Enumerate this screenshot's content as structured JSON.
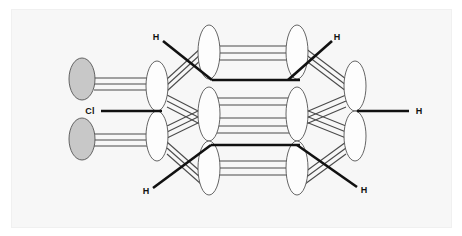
{
  "figure": {
    "background_color": "#ffffff",
    "panel_color": "#f7f7f7",
    "panel_border_color": "#f0f0f0",
    "lobe_fill_white": "#fdfdfd",
    "lobe_fill_gray": "#c8c8c8",
    "lobe_stroke": "#555555",
    "bond_color_thick": "#111111",
    "bond_color_thin": "#4a4a4a"
  },
  "labels": [
    {
      "id": "cl-left",
      "text": "Cl",
      "x": 90,
      "y": 112
    },
    {
      "id": "h-top-left",
      "text": "H",
      "x": 156,
      "y": 38
    },
    {
      "id": "h-bottom-left",
      "text": "H",
      "x": 146,
      "y": 192
    },
    {
      "id": "h-top-right",
      "text": "H",
      "x": 337,
      "y": 38
    },
    {
      "id": "h-bottom-right",
      "text": "H",
      "x": 364,
      "y": 191
    },
    {
      "id": "h-far-right",
      "text": "H",
      "x": 419,
      "y": 112
    }
  ],
  "orbital_columns": [
    {
      "id": "col-1-chlorine-p",
      "kind": "gray",
      "cx": 82,
      "rx": 13,
      "ry": 21,
      "lobes": [
        {
          "cy": 79
        },
        {
          "cy": 139
        }
      ]
    },
    {
      "id": "col-2-carbon-sp3",
      "kind": "white",
      "cx": 157,
      "rx": 11,
      "ry": 25,
      "lobes": [
        {
          "cy": 86
        },
        {
          "cy": 136
        }
      ]
    },
    {
      "id": "col-3-carbon-sp3",
      "kind": "white",
      "cx": 209,
      "rx": 11,
      "ry": 27,
      "lobes": [
        {
          "cy": 52
        },
        {
          "cy": 114
        },
        {
          "cy": 168
        }
      ]
    },
    {
      "id": "col-4-carbon-sp3",
      "kind": "white",
      "cx": 297,
      "rx": 11,
      "ry": 27,
      "lobes": [
        {
          "cy": 52
        },
        {
          "cy": 114
        },
        {
          "cy": 168
        }
      ]
    },
    {
      "id": "col-5-carbon-sp3",
      "kind": "white",
      "cx": 355,
      "rx": 11,
      "ry": 25,
      "lobes": [
        {
          "cy": 86
        },
        {
          "cy": 136
        }
      ]
    }
  ],
  "thick_bonds": [
    {
      "id": "bond-cl-to-c1",
      "x1": 101,
      "y1": 111,
      "x2": 162,
      "y2": 111
    },
    {
      "id": "bond-h-topleft",
      "x1": 163,
      "y1": 41,
      "x2": 212,
      "y2": 80
    },
    {
      "id": "bond-h-bottomleft",
      "x1": 153,
      "y1": 188,
      "x2": 211,
      "y2": 145
    },
    {
      "id": "bond-h-topright",
      "x1": 332,
      "y1": 41,
      "x2": 288,
      "y2": 80
    },
    {
      "id": "bond-h-bottomright",
      "x1": 357,
      "y1": 187,
      "x2": 297,
      "y2": 145
    },
    {
      "id": "bond-mid-upper",
      "x1": 212,
      "y1": 80,
      "x2": 300,
      "y2": 80
    },
    {
      "id": "bond-mid-lower",
      "x1": 211,
      "y1": 145,
      "x2": 300,
      "y2": 145
    },
    {
      "id": "bond-c5-to-h",
      "x1": 357,
      "y1": 111,
      "x2": 409,
      "y2": 111
    }
  ],
  "thin_bond_groups": [
    {
      "id": "group-cl-upper-to-c1",
      "lines": [
        {
          "x1": 94,
          "y1": 78,
          "x2": 155,
          "y2": 78
        },
        {
          "x1": 94,
          "y1": 84,
          "x2": 155,
          "y2": 84
        },
        {
          "x1": 94,
          "y1": 90,
          "x2": 155,
          "y2": 90
        }
      ]
    },
    {
      "id": "group-cl-lower-to-c1",
      "lines": [
        {
          "x1": 94,
          "y1": 134,
          "x2": 155,
          "y2": 134
        },
        {
          "x1": 94,
          "y1": 140,
          "x2": 155,
          "y2": 140
        },
        {
          "x1": 94,
          "y1": 146,
          "x2": 155,
          "y2": 146
        }
      ]
    },
    {
      "id": "group-c1up-to-c2up",
      "lines": [
        {
          "x1": 167,
          "y1": 79,
          "x2": 201,
          "y2": 48
        },
        {
          "x1": 167,
          "y1": 85,
          "x2": 201,
          "y2": 54
        },
        {
          "x1": 167,
          "y1": 91,
          "x2": 201,
          "y2": 60
        }
      ]
    },
    {
      "id": "group-c1up-to-c2mid",
      "lines": [
        {
          "x1": 167,
          "y1": 95,
          "x2": 200,
          "y2": 112
        },
        {
          "x1": 167,
          "y1": 101,
          "x2": 200,
          "y2": 118
        },
        {
          "x1": 167,
          "y1": 107,
          "x2": 200,
          "y2": 124
        }
      ]
    },
    {
      "id": "group-c1low-to-c2mid",
      "lines": [
        {
          "x1": 167,
          "y1": 126,
          "x2": 200,
          "y2": 110
        },
        {
          "x1": 167,
          "y1": 132,
          "x2": 200,
          "y2": 116
        },
        {
          "x1": 167,
          "y1": 138,
          "x2": 200,
          "y2": 122
        }
      ]
    },
    {
      "id": "group-c1low-to-c2low",
      "lines": [
        {
          "x1": 167,
          "y1": 142,
          "x2": 201,
          "y2": 172
        },
        {
          "x1": 167,
          "y1": 148,
          "x2": 201,
          "y2": 178
        },
        {
          "x1": 167,
          "y1": 154,
          "x2": 201,
          "y2": 184
        }
      ]
    },
    {
      "id": "group-c2up-to-c3up",
      "lines": [
        {
          "x1": 216,
          "y1": 46,
          "x2": 291,
          "y2": 46
        },
        {
          "x1": 216,
          "y1": 53,
          "x2": 291,
          "y2": 53
        },
        {
          "x1": 216,
          "y1": 60,
          "x2": 291,
          "y2": 60
        }
      ]
    },
    {
      "id": "group-c2mid-to-c3mid",
      "lines": [
        {
          "x1": 217,
          "y1": 98,
          "x2": 290,
          "y2": 98
        },
        {
          "x1": 217,
          "y1": 105,
          "x2": 290,
          "y2": 105
        },
        {
          "x1": 217,
          "y1": 118,
          "x2": 290,
          "y2": 118
        },
        {
          "x1": 217,
          "y1": 126,
          "x2": 290,
          "y2": 126
        },
        {
          "x1": 217,
          "y1": 133,
          "x2": 290,
          "y2": 133
        }
      ]
    },
    {
      "id": "group-c2low-to-c3low",
      "lines": [
        {
          "x1": 216,
          "y1": 161,
          "x2": 291,
          "y2": 161
        },
        {
          "x1": 216,
          "y1": 168,
          "x2": 291,
          "y2": 168
        },
        {
          "x1": 216,
          "y1": 175,
          "x2": 291,
          "y2": 175
        }
      ]
    },
    {
      "id": "group-c3up-to-c4up",
      "lines": [
        {
          "x1": 305,
          "y1": 48,
          "x2": 346,
          "y2": 79
        },
        {
          "x1": 305,
          "y1": 54,
          "x2": 346,
          "y2": 85
        },
        {
          "x1": 305,
          "y1": 60,
          "x2": 346,
          "y2": 91
        }
      ]
    },
    {
      "id": "group-c3mid-to-c4up",
      "lines": [
        {
          "x1": 306,
          "y1": 112,
          "x2": 346,
          "y2": 95
        },
        {
          "x1": 306,
          "y1": 118,
          "x2": 346,
          "y2": 101
        },
        {
          "x1": 306,
          "y1": 124,
          "x2": 346,
          "y2": 107
        }
      ]
    },
    {
      "id": "group-c3mid-to-c4low",
      "lines": [
        {
          "x1": 306,
          "y1": 110,
          "x2": 346,
          "y2": 126
        },
        {
          "x1": 306,
          "y1": 116,
          "x2": 346,
          "y2": 132
        },
        {
          "x1": 306,
          "y1": 122,
          "x2": 346,
          "y2": 138
        }
      ]
    },
    {
      "id": "group-c3low-to-c4low",
      "lines": [
        {
          "x1": 305,
          "y1": 172,
          "x2": 346,
          "y2": 142
        },
        {
          "x1": 305,
          "y1": 178,
          "x2": 346,
          "y2": 148
        },
        {
          "x1": 305,
          "y1": 184,
          "x2": 346,
          "y2": 154
        }
      ]
    }
  ]
}
